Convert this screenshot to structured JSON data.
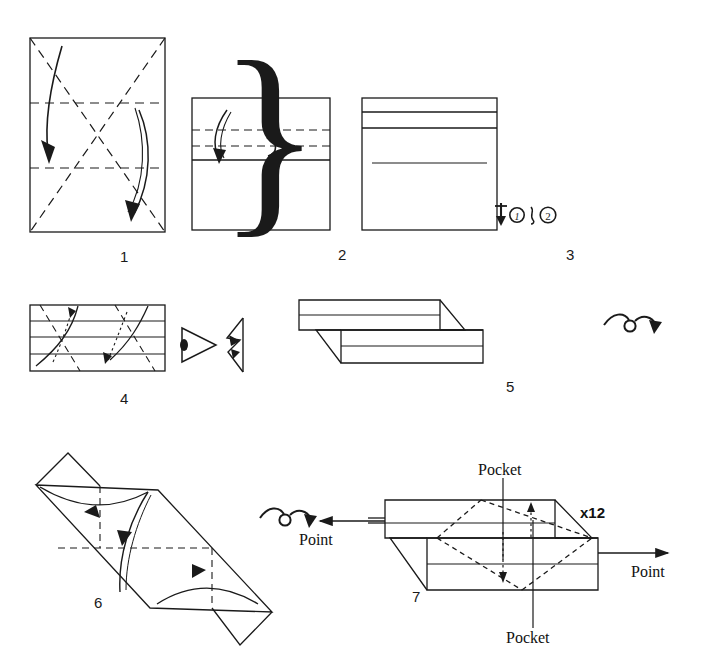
{
  "document": {
    "kind": "origami-instruction-diagram",
    "title": "Modular origami folding sequence",
    "background_color": "#ffffff",
    "ink_color": "#1a1a1a"
  },
  "steps": [
    {
      "number": "1",
      "label_x": 120,
      "label_y": 248,
      "shape": "square",
      "description": "Square sheet with both diagonals creased and two horizontal thirds creases; two curved arrows fold top and bottom edges to the creases."
    },
    {
      "number": "2",
      "label_x": 338,
      "label_y": 246,
      "shape": "wide-rectangle",
      "description": "Folded rectangle with two dashed horizontal crease lines and curved arrows."
    },
    {
      "number": "3",
      "label_x": 566,
      "label_y": 246,
      "shape": "wide-rectangle",
      "description": "Banded rectangle with repeat symbol for steps 1 and 2."
    },
    {
      "number": "4",
      "label_x": 120,
      "label_y": 390,
      "shape": "banded-strip",
      "description": "Long banded strip with dashed diagonal creases and dotted fold arrows."
    },
    {
      "number": "5",
      "label_x": 506,
      "label_y": 378,
      "shape": "offset-parallelogram-unit",
      "description": "Assembled three-dimensional unit with two offset bars; turn-over arrow at right."
    },
    {
      "number": "6",
      "label_x": 94,
      "label_y": 594,
      "shape": "diagonal-parallelogram",
      "description": "Diagonal module with flaps folded in, shown with three curved arrows; turn-over arrow at right."
    },
    {
      "number": "7",
      "label_x": 412,
      "label_y": 588,
      "shape": "assembled-unit",
      "description": "Finished unit showing the pockets and the points used for assembly."
    }
  ],
  "annotations": {
    "repeat_symbol": {
      "arrow": "down-arrow",
      "first_circled": "1",
      "separator": "&",
      "second_circled": "2",
      "meaning": "repeat steps 1 and 2"
    },
    "eye_symbol": "view-from-here-eye-icon",
    "push_symbol": "push-here-icon",
    "turn_over_step5": "turn-over-arrow-icon",
    "turn_over_step6": "turn-over-arrow-icon",
    "quantity": "x12",
    "quantity_x": 596,
    "quantity_y": 512,
    "pocket_top": "Pocket",
    "pocket_top_x": 478,
    "pocket_top_y": 470,
    "pocket_bottom": "Pocket",
    "pocket_bottom_x": 533,
    "pocket_bottom_y": 638,
    "point_left": "Point",
    "point_left_x": 302,
    "point_left_y": 538,
    "point_right": "Point",
    "point_right_x": 635,
    "point_right_y": 570
  }
}
